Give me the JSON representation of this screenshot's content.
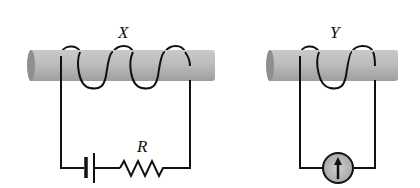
{
  "diagram": {
    "labels": {
      "rod_x": "X",
      "rod_y": "Y",
      "resistor": "R"
    },
    "components": [
      {
        "id": "rod-x",
        "type": "iron-rod",
        "coil_turns": 3
      },
      {
        "id": "battery",
        "type": "cell",
        "circuit": "X"
      },
      {
        "id": "resistor",
        "type": "resistor",
        "label": "R",
        "circuit": "X"
      },
      {
        "id": "rod-y",
        "type": "iron-rod",
        "coil_turns": 2
      },
      {
        "id": "galvanometer",
        "type": "galvanometer",
        "needle": "up",
        "circuit": "Y"
      }
    ],
    "colors": {
      "rod": "#b5b5b5",
      "rod_end": "#8f8f8f",
      "wire": "#111111",
      "galvanometer_face": "#c8c8c8"
    }
  }
}
